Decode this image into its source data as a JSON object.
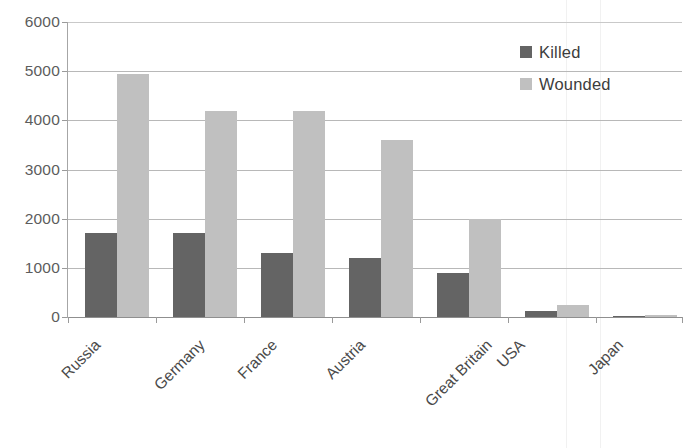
{
  "chart_data": {
    "type": "bar",
    "title": "",
    "subtitle": "",
    "xlabel": "",
    "ylabel": "",
    "categories": [
      "Russia",
      "Germany",
      "France",
      "Austria",
      "Great Britain",
      "USA",
      "Japan"
    ],
    "series": [
      {
        "name": "Killed",
        "color": "#646464",
        "values": [
          1700,
          1700,
          1300,
          1200,
          900,
          120,
          30
        ]
      },
      {
        "name": "Wounded",
        "color": "#c0c0c0",
        "values": [
          4950,
          4200,
          4200,
          3600,
          2000,
          250,
          35
        ]
      }
    ],
    "ylim": [
      0,
      6000
    ],
    "yticks": [
      6000,
      5000,
      4000,
      3000,
      2000,
      1000,
      0
    ],
    "ytick_labels": [
      "6000",
      "5000",
      "4000",
      "3000",
      "2000",
      "1000",
      "0"
    ],
    "grid": true,
    "grid_axis": "y",
    "legend": [
      "Killed",
      "Wounded"
    ],
    "legend_position": "top-right",
    "xtick_label_rotation": -45
  },
  "legend": {
    "killed_label": "Killed",
    "wounded_label": "Wounded"
  },
  "axis": {
    "y_labels": [
      "6000",
      "5000",
      "4000",
      "3000",
      "2000",
      "1000",
      "0"
    ],
    "x_labels": [
      "Russia",
      "Germany",
      "France",
      "Austria",
      "Great Britain",
      "USA",
      "Japan"
    ]
  },
  "colors": {
    "killed": "#646464",
    "wounded": "#c0c0c0",
    "gridline": "#b8b8b8",
    "background": "#ffffff"
  }
}
